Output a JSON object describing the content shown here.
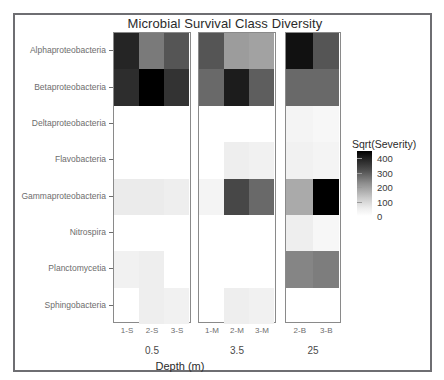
{
  "chart_data": {
    "type": "heatmap",
    "title": "Microbial Survival Class Diversity",
    "xlabel": "Depth (m)",
    "ylabel": "",
    "legend_title": "Sqrt(Severity)",
    "legend_ticks": [
      400,
      300,
      200,
      100,
      0
    ],
    "legend_range": [
      0,
      450
    ],
    "legend_position": "right",
    "colormap": "grayscale-reversed (dark = high)",
    "grid": false,
    "panels": [
      {
        "strip_label": "0.5",
        "columns": [
          "1-S",
          "2-S",
          "3-S"
        ]
      },
      {
        "strip_label": "3.5",
        "columns": [
          "1-M",
          "2-M",
          "3-M"
        ]
      },
      {
        "strip_label": "25",
        "columns": [
          "2-B",
          "3-B"
        ]
      }
    ],
    "rows": [
      "Alphaproteobacteria",
      "Betaproteobacteria",
      "Deltaproteobacteria",
      "Flavobacteria",
      "Gammaproteobacteria",
      "Nitrospira",
      "Planctomycetia",
      "Sphingobacteria"
    ],
    "values": {
      "0.5": {
        "Alphaproteobacteria": [
          385,
          235,
          300
        ],
        "Betaproteobacteria": [
          370,
          450,
          360
        ],
        "Deltaproteobacteria": [
          null,
          null,
          null
        ],
        "Flavobacteria": [
          null,
          null,
          null
        ],
        "Gammaproteobacteria": [
          35,
          35,
          30
        ],
        "Nitrospira": [
          null,
          null,
          null
        ],
        "Planctomycetia": [
          25,
          30,
          null
        ],
        "Sphingobacteria": [
          null,
          30,
          25
        ]
      },
      "3.5": {
        "Alphaproteobacteria": [
          300,
          175,
          165
        ],
        "Betaproteobacteria": [
          265,
          400,
          285
        ],
        "Deltaproteobacteria": [
          null,
          null,
          null
        ],
        "Flavobacteria": [
          null,
          30,
          25
        ],
        "Gammaproteobacteria": [
          20,
          325,
          265
        ],
        "Nitrospira": [
          null,
          null,
          null
        ],
        "Planctomycetia": [
          null,
          null,
          null
        ],
        "Sphingobacteria": [
          null,
          30,
          25
        ]
      },
      "25": {
        "Alphaproteobacteria": [
          420,
          300
        ],
        "Betaproteobacteria": [
          265,
          265
        ],
        "Deltaproteobacteria": [
          20,
          15
        ],
        "Flavobacteria": [
          25,
          20
        ],
        "Gammaproteobacteria": [
          150,
          450
        ],
        "Nitrospira": [
          30,
          15
        ],
        "Planctomycetia": [
          215,
          230
        ],
        "Sphingobacteria": [
          null,
          null
        ]
      }
    }
  },
  "colors": {
    "frame": "#6e6e72",
    "panel_border": "#8a8a8a",
    "axis_text": "#6d6d6d",
    "title_text": "#2b2b2b"
  }
}
